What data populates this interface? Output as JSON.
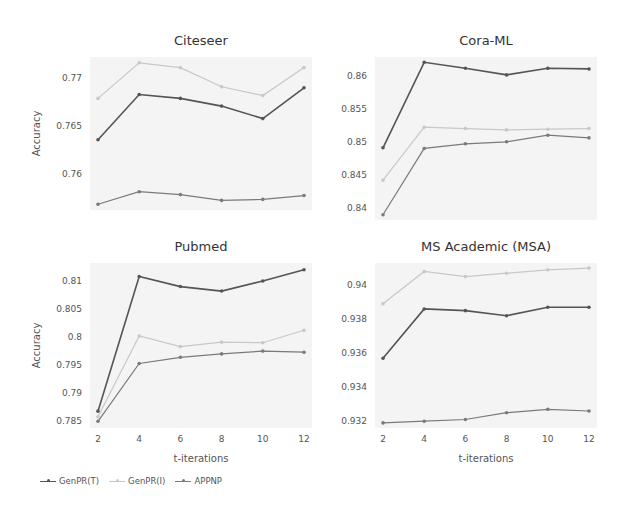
{
  "chart_data": [
    {
      "type": "line",
      "title": "Citeseer",
      "xlabel": "",
      "ylabel": "Accuracy",
      "x": [
        2,
        4,
        6,
        8,
        10,
        12
      ],
      "yticks": [
        0.76,
        0.765,
        0.77
      ],
      "ytick_labels": [
        "0.76",
        "0.765",
        "0.77"
      ],
      "ylim": [
        0.7563,
        0.7722
      ],
      "show_xticks": false,
      "grid": false,
      "series": [
        {
          "name": "GenPR(T)",
          "values": [
            0.7636,
            0.7683,
            0.7679,
            0.7671,
            0.7658,
            0.769
          ]
        },
        {
          "name": "GenPR(I)",
          "values": [
            0.7679,
            0.7716,
            0.7711,
            0.7691,
            0.7682,
            0.7711
          ]
        },
        {
          "name": "APPNP",
          "values": [
            0.7569,
            0.7582,
            0.7579,
            0.7573,
            0.7574,
            0.7578
          ]
        }
      ]
    },
    {
      "type": "line",
      "title": "Cora-ML",
      "xlabel": "",
      "ylabel": "",
      "x": [
        2,
        4,
        6,
        8,
        10,
        12
      ],
      "yticks": [
        0.84,
        0.845,
        0.85,
        0.855,
        0.86
      ],
      "ytick_labels": [
        "0.84",
        "0.845",
        "0.85",
        "0.855",
        "0.86"
      ],
      "ylim": [
        0.8382,
        0.8628
      ],
      "show_xticks": false,
      "grid": false,
      "series": [
        {
          "name": "GenPR(T)",
          "values": [
            0.8491,
            0.862,
            0.8611,
            0.8601,
            0.8611,
            0.861
          ]
        },
        {
          "name": "GenPR(I)",
          "values": [
            0.8442,
            0.8522,
            0.852,
            0.8518,
            0.8519,
            0.852
          ]
        },
        {
          "name": "APPNP",
          "values": [
            0.839,
            0.849,
            0.8497,
            0.85,
            0.851,
            0.8506
          ]
        }
      ]
    },
    {
      "type": "line",
      "title": "Pubmed",
      "xlabel": "t-iterations",
      "ylabel": "Accuracy",
      "x": [
        2,
        4,
        6,
        8,
        10,
        12
      ],
      "yticks": [
        0.785,
        0.79,
        0.795,
        0.8,
        0.805,
        0.81
      ],
      "ytick_labels": [
        "0.785",
        "0.79",
        "0.795",
        "0.8",
        "0.805",
        "0.81"
      ],
      "ylim": [
        0.7838,
        0.8132
      ],
      "show_xticks": true,
      "grid": false,
      "series": [
        {
          "name": "GenPR(T)",
          "values": [
            0.7868,
            0.8108,
            0.809,
            0.8082,
            0.81,
            0.812
          ]
        },
        {
          "name": "GenPR(I)",
          "values": [
            0.7858,
            0.8002,
            0.7983,
            0.7991,
            0.799,
            0.8012
          ]
        },
        {
          "name": "APPNP",
          "values": [
            0.785,
            0.7953,
            0.7964,
            0.797,
            0.7975,
            0.7973
          ]
        }
      ]
    },
    {
      "type": "line",
      "title": "MS Academic (MSA)",
      "xlabel": "t-iterations",
      "ylabel": "",
      "x": [
        2,
        4,
        6,
        8,
        10,
        12
      ],
      "yticks": [
        0.932,
        0.934,
        0.936,
        0.938,
        0.94
      ],
      "ytick_labels": [
        "0.932",
        "0.934",
        "0.936",
        "0.938",
        "0.94"
      ],
      "ylim": [
        0.9316,
        0.9413
      ],
      "show_xticks": true,
      "grid": false,
      "series": [
        {
          "name": "GenPR(T)",
          "values": [
            0.9357,
            0.9386,
            0.9385,
            0.9382,
            0.9387,
            0.9387
          ]
        },
        {
          "name": "GenPR(I)",
          "values": [
            0.9389,
            0.9408,
            0.9405,
            0.9407,
            0.9409,
            0.941
          ]
        },
        {
          "name": "APPNP",
          "values": [
            0.9319,
            0.932,
            0.9321,
            0.9325,
            0.9327,
            0.9326
          ]
        }
      ]
    }
  ],
  "legend": {
    "position": "bottom-left",
    "items": [
      {
        "name": "GenPR(T)",
        "color": "#555555"
      },
      {
        "name": "GenPR(I)",
        "color": "#c8c8c8"
      },
      {
        "name": "APPNP",
        "color": "#7a7a7a"
      }
    ]
  },
  "colors": {
    "GenPR(T)": "#555555",
    "GenPR(I)": "#c8c8c8",
    "APPNP": "#7a7a7a",
    "plot_bg": "#f4f4f4"
  }
}
